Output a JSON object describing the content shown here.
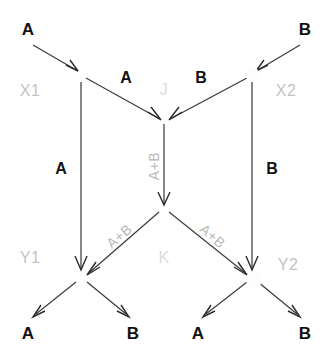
{
  "diagram": {
    "type": "flow-graph",
    "background_color": "#ffffff",
    "edge_color": "#3d3d3d",
    "io_label_color": "#111111",
    "node_label_color": "#c3c3c3",
    "sum_label_color": "#b8b8b8",
    "inputs": {
      "top_left": "A",
      "top_right": "B"
    },
    "nodes": {
      "x1": "X1",
      "x2": "X2",
      "j": "J",
      "k": "K",
      "y1": "Y1",
      "y2": "Y2"
    },
    "edge_labels": {
      "x1_to_j": "A",
      "x2_to_j": "B",
      "x1_to_y1": "A",
      "x2_to_y2": "B",
      "j_to_k": "A+B",
      "k_to_y1": "A+B",
      "k_to_y2": "A+B"
    },
    "outputs": {
      "y1_left": "A",
      "y1_right": "B",
      "y2_left": "A",
      "y2_right": "B"
    }
  }
}
